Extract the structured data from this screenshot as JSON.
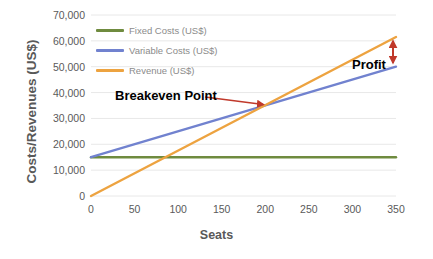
{
  "chart_data": {
    "type": "line",
    "title": "",
    "subtitle": "",
    "xlabel": "Seats",
    "ylabel": "Costs/Revenues (US$)",
    "xlim": [
      0,
      350
    ],
    "ylim": [
      0,
      70000
    ],
    "xticks": [
      0,
      50,
      100,
      150,
      200,
      250,
      300,
      350
    ],
    "xtick_labels": [
      "0",
      "50",
      "100",
      "150",
      "200",
      "250",
      "300",
      "350"
    ],
    "yticks": [
      0,
      10000,
      20000,
      30000,
      40000,
      50000,
      60000,
      70000
    ],
    "ytick_labels": [
      "0",
      "10,000",
      "20,000",
      "30,000",
      "40,000",
      "50,000",
      "60,000",
      "70,000"
    ],
    "grid": true,
    "grid_axis": "y",
    "legend_position": "top-left-inside",
    "x": [
      0,
      350
    ],
    "series": [
      {
        "name": "Fixed Costs (US$)",
        "color": "#6f8b3f",
        "values": [
          15000,
          15000
        ]
      },
      {
        "name": "Variable Costs (US$)",
        "color": "#7182cf",
        "values": [
          15000,
          50000
        ]
      },
      {
        "name": "Revenue (US$)",
        "color": "#eda340",
        "values": [
          0,
          61500
        ]
      }
    ],
    "annotations": [
      {
        "name": "breakeven-point",
        "text": "Breakeven Point",
        "color": "#c0392b",
        "point_x": 200,
        "point_y": 35000
      },
      {
        "name": "profit",
        "text": "Profit",
        "color": "#c0392b",
        "point_x": 350,
        "span_y": [
          50000,
          61500
        ]
      }
    ]
  },
  "axis": {
    "y_title": "Costs/Revenues (US$)",
    "x_title": "Seats"
  },
  "legend": {
    "items": [
      {
        "label": "Fixed Costs (US$)",
        "color": "#6f8b3f"
      },
      {
        "label": "Variable Costs (US$)",
        "color": "#7182cf"
      },
      {
        "label": "Revenue (US$)",
        "color": "#eda340"
      }
    ]
  },
  "annotations": {
    "breakeven": "Breakeven Point",
    "profit": "Profit"
  },
  "colors": {
    "fixed_costs": "#6f8b3f",
    "variable_costs": "#7182cf",
    "revenue": "#eda340",
    "annotation_red": "#c0392b",
    "grid": "#e8e8e8",
    "tick_text": "#5a5a5a",
    "axis_title": "#595959",
    "legend_text": "#8b8b8b"
  }
}
